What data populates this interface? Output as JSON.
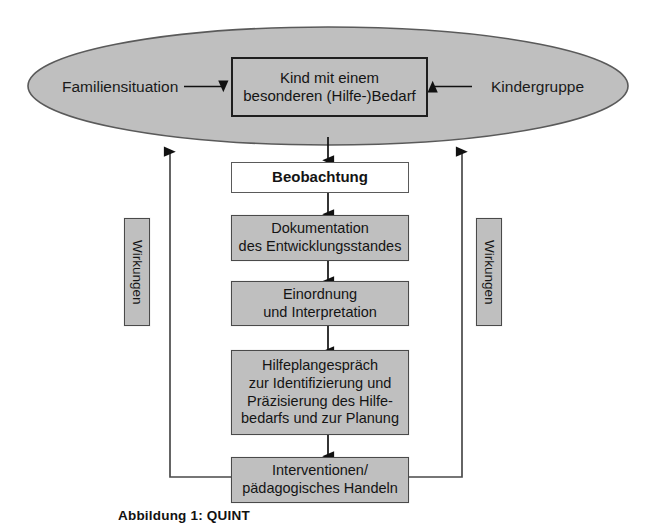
{
  "diagram": {
    "title_caption": "Abbildung 1: QUINT",
    "colors": {
      "fill_gray": "#bfbfbf",
      "fill_white": "#ffffff",
      "stroke_dark": "#1e1e1e",
      "stroke_medium": "#4a4a4a",
      "text": "#141414",
      "background": "#ffffff"
    },
    "ellipse": {
      "name": "context-ellipse",
      "fill": "#bfbfbf",
      "stroke": "#555555"
    },
    "center_node": {
      "line1": "Kind mit einem",
      "line2": "besonderen (Hilfe-)Bedarf"
    },
    "inputs": {
      "left": "Familiensituation",
      "right": "Kindergruppe"
    },
    "side_labels": {
      "left": "Wirkungen",
      "right": "Wirkungen"
    },
    "process_steps": [
      {
        "id": "beobachtung",
        "lines": [
          "Beobachtung"
        ],
        "style": "white",
        "bold": true
      },
      {
        "id": "dokumentation",
        "lines": [
          "Dokumentation",
          "des Entwicklungsstandes"
        ],
        "style": "gray",
        "bold": false
      },
      {
        "id": "einordnung",
        "lines": [
          "Einordnung",
          "und Interpretation"
        ],
        "style": "gray",
        "bold": false
      },
      {
        "id": "hilfeplangespraech",
        "lines": [
          "Hilfeplangespräch",
          "zur Identifizierung und",
          "Präzisierung des Hilfe-",
          "bedarfs und zur Planung"
        ],
        "style": "gray",
        "bold": false
      },
      {
        "id": "interventionen",
        "lines": [
          "Interventionen/",
          "pädagogisches Handeln"
        ],
        "style": "gray",
        "bold": false
      }
    ]
  }
}
